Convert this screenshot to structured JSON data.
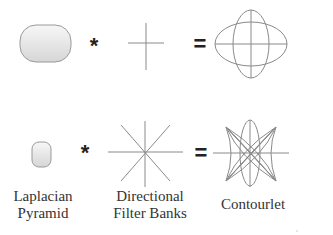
{
  "diagram": {
    "title": "",
    "rows": [
      {
        "id": "top-row",
        "operator_1": "*",
        "operator_2": "="
      },
      {
        "id": "bottom-row",
        "operator_1": "*",
        "operator_2": "="
      }
    ],
    "labels": {
      "laplacian": {
        "line1": "Laplacian",
        "line2": "Pyramid"
      },
      "dfb": {
        "line1": "Directional",
        "line2": "Filter Banks"
      },
      "contourlet": {
        "line1": "Contourlet"
      }
    },
    "colors": {
      "stroke": "#8a8a8a",
      "box_fill_top": "#f4f4f4",
      "box_fill_bottom": "#dcdcdc",
      "box_stroke": "#9a9a9a",
      "text": "#333333"
    }
  }
}
